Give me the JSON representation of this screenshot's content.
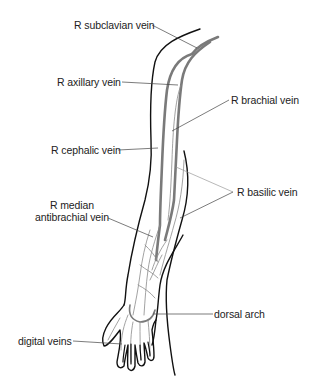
{
  "diagram": {
    "labels": {
      "subclavian": "R subclavian vein",
      "axillary": "R axillary vein",
      "brachial": "R brachial vein",
      "cephalic": "R cephalic vein",
      "basilic": "R basilic vein",
      "median_line1": "R median",
      "median_line2": "antibrachial vein",
      "dorsal_arch": "dorsal arch",
      "digital": "digital veins"
    },
    "colors": {
      "outline": "#111111",
      "vein": "#7a7a7a",
      "text": "#222222",
      "background": "#ffffff"
    }
  }
}
